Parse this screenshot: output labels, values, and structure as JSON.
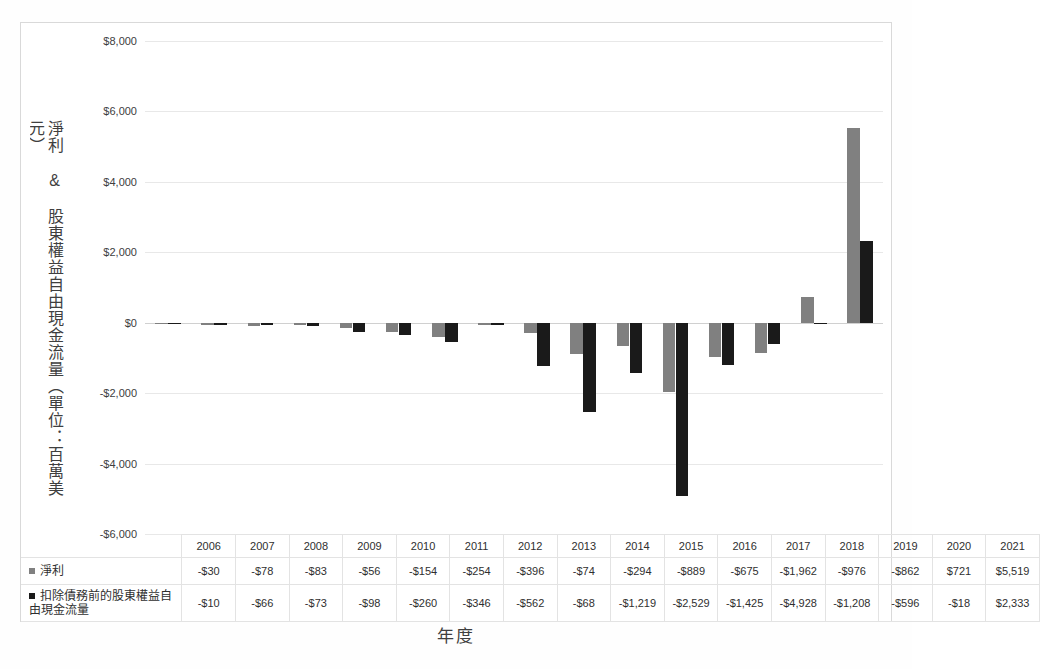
{
  "chart_data": {
    "type": "bar",
    "title": "",
    "xlabel": "年度",
    "ylabel": "淨利 & 股東權益自由現金流量（單位：百萬美元）",
    "categories": [
      "2006",
      "2007",
      "2008",
      "2009",
      "2010",
      "2011",
      "2012",
      "2013",
      "2014",
      "2015",
      "2016",
      "2017",
      "2018",
      "2019",
      "2020",
      "2021"
    ],
    "ylim": [
      -6000,
      8000
    ],
    "yticks": [
      8000,
      6000,
      4000,
      2000,
      0,
      -2000,
      -4000,
      -6000
    ],
    "ytick_labels": [
      "$8,000",
      "$6,000",
      "$4,000",
      "$2,000",
      "$0",
      "-$2,000",
      "-$4,000",
      "-$6,000"
    ],
    "grid": true,
    "legend_position": "table-left",
    "series": [
      {
        "name": "淨利",
        "color": "#808080",
        "values": [
          -30,
          -78,
          -83,
          -56,
          -154,
          -254,
          -396,
          -74,
          -294,
          -889,
          -675,
          -1962,
          -976,
          -862,
          721,
          5519
        ],
        "labels": [
          "-$30",
          "-$78",
          "-$83",
          "-$56",
          "-$154",
          "-$254",
          "-$396",
          "-$74",
          "-$294",
          "-$889",
          "-$675",
          "-$1,962",
          "-$976",
          "-$862",
          "$721",
          "$5,519"
        ]
      },
      {
        "name": "扣除債務前的股東權益自由現金流量",
        "color": "#1a1a1a",
        "values": [
          -10,
          -66,
          -73,
          -98,
          -260,
          -346,
          -562,
          -68,
          -1219,
          -2529,
          -1425,
          -4928,
          -1208,
          -596,
          -18,
          2333
        ],
        "labels": [
          "-$10",
          "-$66",
          "-$73",
          "-$98",
          "-$260",
          "-$346",
          "-$562",
          "-$68",
          "-$1,219",
          "-$2,529",
          "-$1,425",
          "-$4,928",
          "-$1,208",
          "-$596",
          "-$18",
          "$2,333"
        ]
      }
    ]
  },
  "axis": {
    "y_title": "淨利 & 股東權益自由現金流量（單位：百萬美元）",
    "x_title": "年度"
  },
  "table": {
    "header_blank": "",
    "years": [
      "2006",
      "2007",
      "2008",
      "2009",
      "2010",
      "2011",
      "2012",
      "2013",
      "2014",
      "2015",
      "2016",
      "2017",
      "2018",
      "2019",
      "2020",
      "2021"
    ],
    "rows": [
      {
        "label": "淨利",
        "swatch": "gray-square-marker",
        "values": [
          "-$30",
          "-$78",
          "-$83",
          "-$56",
          "-$154",
          "-$254",
          "-$396",
          "-$74",
          "-$294",
          "-$889",
          "-$675",
          "-$1,962",
          "-$976",
          "-$862",
          "$721",
          "$5,519"
        ]
      },
      {
        "label": "扣除債務前的股東權益自由現金流量",
        "swatch": "black-square-marker",
        "values": [
          "-$10",
          "-$66",
          "-$73",
          "-$98",
          "-$260",
          "-$346",
          "-$562",
          "-$68",
          "-$1,219",
          "-$2,529",
          "-$1,425",
          "-$4,928",
          "-$1,208",
          "-$596",
          "-$18",
          "$2,333"
        ]
      }
    ]
  },
  "colors": {
    "net_income": "#808080",
    "free_cash_flow": "#1a1a1a",
    "gridline": "#e8e8e8",
    "frame": "#d9d9d9"
  }
}
